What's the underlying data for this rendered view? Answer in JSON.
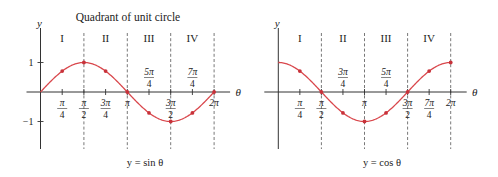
{
  "figure": {
    "title": "Quadrant of unit circle"
  },
  "chart_data": [
    {
      "type": "line",
      "function": "sin",
      "caption": "y = sin θ",
      "xlabel": "θ",
      "ylabel": "y",
      "xlim": [
        "0",
        "2π"
      ],
      "ylim": [
        -1,
        1
      ],
      "grid": false,
      "quadrants": [
        "I",
        "II",
        "III",
        "IV"
      ],
      "quadrant_boundaries": [
        "π/2",
        "π",
        "3π/2",
        "2π"
      ],
      "y_ticks": [
        {
          "value": 1,
          "label": "1"
        },
        {
          "value": -1,
          "label": "−1"
        }
      ],
      "x_ticks": [
        {
          "k": 1,
          "num": "π",
          "den": "4",
          "pos": "below"
        },
        {
          "k": 2,
          "num": "π",
          "den": "2",
          "pos": "below"
        },
        {
          "k": 3,
          "num": "3π",
          "den": "4",
          "pos": "below"
        },
        {
          "k": 4,
          "num": "π",
          "den": "",
          "pos": "below"
        },
        {
          "k": 5,
          "num": "5π",
          "den": "4",
          "pos": "above"
        },
        {
          "k": 6,
          "num": "3π",
          "den": "2",
          "pos": "below"
        },
        {
          "k": 7,
          "num": "7π",
          "den": "4",
          "pos": "above"
        },
        {
          "k": 8,
          "num": "2π",
          "den": "",
          "pos": "below"
        }
      ],
      "x": [
        "0",
        "π/4",
        "π/2",
        "3π/4",
        "π",
        "5π/4",
        "3π/2",
        "7π/4",
        "2π"
      ],
      "values": [
        0,
        0.71,
        1,
        0.71,
        0,
        -0.71,
        -1,
        -0.71,
        0
      ],
      "markers_at": [
        1,
        2,
        3,
        4,
        5,
        6,
        7,
        8
      ],
      "color": "#d9474c",
      "marker_color": "#c8323a"
    },
    {
      "type": "line",
      "function": "cos",
      "caption": "y = cos θ",
      "xlabel": "θ",
      "ylabel": "y",
      "xlim": [
        "0",
        "2π"
      ],
      "ylim": [
        -1,
        1
      ],
      "grid": false,
      "quadrants": [
        "I",
        "II",
        "III",
        "IV"
      ],
      "quadrant_boundaries": [
        "π/2",
        "π",
        "3π/2",
        "2π"
      ],
      "y_ticks": [],
      "x_ticks": [
        {
          "k": 1,
          "num": "π",
          "den": "4",
          "pos": "below"
        },
        {
          "k": 2,
          "num": "π",
          "den": "2",
          "pos": "below"
        },
        {
          "k": 3,
          "num": "3π",
          "den": "4",
          "pos": "above"
        },
        {
          "k": 4,
          "num": "π",
          "den": "",
          "pos": "below"
        },
        {
          "k": 5,
          "num": "5π",
          "den": "4",
          "pos": "above"
        },
        {
          "k": 6,
          "num": "3π",
          "den": "2",
          "pos": "below"
        },
        {
          "k": 7,
          "num": "7π",
          "den": "4",
          "pos": "below"
        },
        {
          "k": 8,
          "num": "2π",
          "den": "",
          "pos": "below"
        }
      ],
      "x": [
        "0",
        "π/4",
        "π/2",
        "3π/4",
        "π",
        "5π/4",
        "3π/2",
        "7π/4",
        "2π"
      ],
      "values": [
        1,
        0.71,
        0,
        -0.71,
        -1,
        -0.71,
        0,
        0.71,
        1
      ],
      "markers_at": [
        1,
        2,
        3,
        4,
        5,
        6,
        7,
        8
      ],
      "color": "#d9474c",
      "marker_color": "#c8323a"
    }
  ]
}
